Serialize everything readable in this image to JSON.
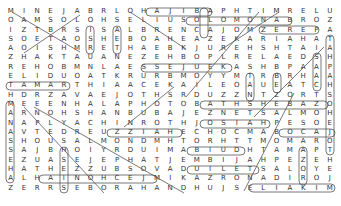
{
  "puzzle": {
    "type": "word-search",
    "rows": 20,
    "cols": 25,
    "grid": [
      "MINEJABRLOHAJIBAPHTIMRELU",
      "OAMSOLOHSELIUSOLOMONABROZ",
      "IZTBRSISALBRENCAJOMZEREPA",
      "SOETAOSHEBOAHEAZEKARIAHAT",
      "AOISHMRETHAEBKJUREHSHTAIA",
      "ZHAKTAUANEZEHBOPLRELAEDSH",
      "REHOBMNLAESSEJUEKASHBPAAP",
      "ELIDUOATKRURBMOYYMTRBRHAA",
      "TAMARTHIAACEKAILEOAUEATCH",
      "HDRZAVAEJOTHSRDUZZNTZORTS",
      "MEEENHALAPHOTOBATHSHEBAZO",
      "ARNOHSHANBUBAJEZNETSALMOH",
      "NAPLYACHINROTHJOSIAHPESOE",
      "AVTEDREUZZIAHECHOCMABOCAJ",
      "SHOUSALMONDMHTORHTTMOMARO",
      "SAJBHOIYRDUIMABIUDHTAMAPT",
      "EZUASEJEPHATJEMBIJAHPEZEH",
      "HATHEZZUBSOVADUILETSALOYE",
      "ALHAINOHCEJMIKAZRONADIROJ",
      "ZERRSEBORAHANDHUJSELIAKIM"
    ],
    "found_words_visible": [
      "HAJIB",
      "SOLOMON",
      "ZEREP",
      "BATHSHEBA",
      "JOSIAH",
      "UZZIAH",
      "BOCAJ",
      "ABIUD",
      "DUILE",
      "ELIAKIM",
      "HAINOHCEJ",
      "TAMAR",
      "ESSEJ",
      "SALMON",
      "HSHANAN"
    ],
    "colors": {
      "letter": "#333333",
      "circle_stroke": "#555555",
      "background": "#ffffff"
    }
  }
}
